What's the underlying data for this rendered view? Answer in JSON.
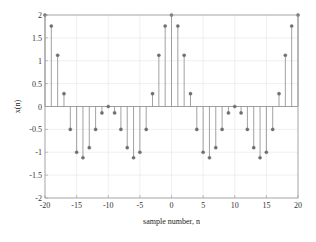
{
  "chart_data": {
    "type": "stem",
    "title": "",
    "xlabel": "sample number, n",
    "ylabel": "x(n)",
    "xlim": [
      -20,
      20
    ],
    "ylim": [
      -2,
      2
    ],
    "grid": true,
    "legend": null,
    "x_ticks": [
      -20,
      -15,
      -10,
      -5,
      0,
      5,
      10,
      15,
      20
    ],
    "x_tick_labels": [
      "-20",
      "-15",
      "-10",
      "-5",
      "0",
      "5",
      "10",
      "15",
      "20"
    ],
    "y_ticks": [
      2,
      1.5,
      1,
      0.5,
      0,
      -0.5,
      -1,
      -1.5,
      -2
    ],
    "y_tick_labels": [
      "2",
      "1.5",
      "1",
      "0.5",
      "0",
      "-0.5",
      "-1",
      "-1.5",
      "-2"
    ],
    "x": [
      -20,
      -19,
      -18,
      -17,
      -16,
      -15,
      -14,
      -13,
      -12,
      -11,
      -10,
      -9,
      -8,
      -7,
      -6,
      -5,
      -4,
      -3,
      -2,
      -1,
      0,
      1,
      2,
      3,
      4,
      5,
      6,
      7,
      8,
      9,
      10,
      11,
      12,
      13,
      14,
      15,
      16,
      17,
      18,
      19,
      20
    ],
    "values": [
      2,
      1.76,
      1.12,
      0.28,
      -0.5,
      -1,
      -1.12,
      -0.9,
      -0.5,
      -0.14,
      0,
      -0.14,
      -0.5,
      -0.9,
      -1.12,
      -1,
      -0.5,
      0.28,
      1.12,
      1.76,
      2,
      1.76,
      1.12,
      0.28,
      -0.5,
      -1,
      -1.12,
      -0.9,
      -0.5,
      -0.14,
      0,
      -0.14,
      -0.5,
      -0.9,
      -1.12,
      -1,
      -0.5,
      0.28,
      1.12,
      1.76,
      2
    ],
    "colors": {
      "stem": "#8a8a8a",
      "marker": "#6e6e6e",
      "axes": "#9a9a9a",
      "grid": "#e6e6e6",
      "baseline": "#8a8a8a"
    }
  }
}
